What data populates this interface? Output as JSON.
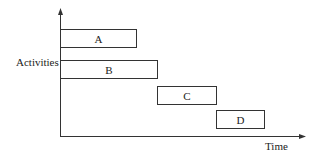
{
  "diagram": {
    "type": "gantt",
    "y_label": "Activities",
    "x_label": "Time",
    "activities": [
      {
        "label": "A",
        "start": 0,
        "end": 76
      },
      {
        "label": "B",
        "start": 0,
        "end": 97
      },
      {
        "label": "C",
        "start": 97,
        "end": 156
      },
      {
        "label": "D",
        "start": 156,
        "end": 204
      }
    ]
  }
}
